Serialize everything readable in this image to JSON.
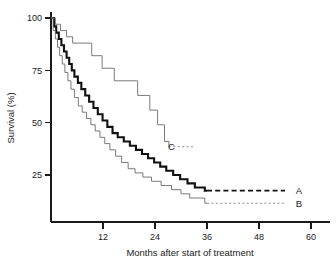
{
  "chart_data": {
    "type": "line",
    "title": "",
    "subtitle": "",
    "xlabel": "Months after start of treatment",
    "ylabel": "Survival (%)",
    "xlim": [
      0,
      60
    ],
    "ylim": [
      0,
      100
    ],
    "xticks": [
      12,
      24,
      36,
      48,
      60
    ],
    "xticklabels": [
      "12",
      "24",
      "36",
      "48",
      "60"
    ],
    "yticks": [
      25,
      50,
      75,
      100
    ],
    "yticklabels": [
      "25",
      "50",
      "75",
      "100"
    ],
    "grid": false,
    "legend_position": "inline-right-labels",
    "annotations": [
      {
        "text": "A",
        "x": 56.5,
        "y": 17.5,
        "leader": "dashed-bold",
        "leader_from_x": 36.0,
        "leader_to_x": 54.0
      },
      {
        "text": "B",
        "x": 56.5,
        "y": 11.5,
        "leader": "dotted-thin",
        "leader_from_x": 36.0,
        "leader_to_x": 54.0
      },
      {
        "text": "C",
        "x": 27.0,
        "y": 38.5,
        "leader": "dotted-thin",
        "leader_from_x": 27.2,
        "leader_to_x": 33.0
      }
    ],
    "series": [
      {
        "name": "A",
        "label": "A",
        "style": "bold-solid-black",
        "color": "#111111",
        "final_survival_pct": 17.5,
        "last_event_month": 35.5,
        "steps": [
          [
            0.0,
            100
          ],
          [
            0.7,
            96
          ],
          [
            1.2,
            93
          ],
          [
            1.8,
            90
          ],
          [
            2.4,
            87
          ],
          [
            3.0,
            84
          ],
          [
            3.6,
            81
          ],
          [
            4.2,
            78
          ],
          [
            4.8,
            75
          ],
          [
            5.4,
            72
          ],
          [
            6.2,
            69
          ],
          [
            7.0,
            66
          ],
          [
            7.9,
            63
          ],
          [
            8.8,
            60
          ],
          [
            9.8,
            57
          ],
          [
            10.8,
            54
          ],
          [
            11.9,
            51
          ],
          [
            13.0,
            48
          ],
          [
            14.2,
            45
          ],
          [
            15.4,
            43
          ],
          [
            16.8,
            41
          ],
          [
            18.2,
            39
          ],
          [
            19.6,
            37
          ],
          [
            21.0,
            35
          ],
          [
            22.4,
            33
          ],
          [
            23.8,
            31
          ],
          [
            25.2,
            29
          ],
          [
            26.6,
            27
          ],
          [
            28.2,
            25
          ],
          [
            29.8,
            23
          ],
          [
            31.5,
            21
          ],
          [
            33.2,
            19
          ],
          [
            35.5,
            17.5
          ],
          [
            36.0,
            17.5
          ]
        ]
      },
      {
        "name": "B",
        "label": "B",
        "style": "thin-solid-grey",
        "color": "#6b6b6b",
        "final_survival_pct": 11.5,
        "last_event_month": 35.5,
        "steps": [
          [
            0.0,
            100
          ],
          [
            0.5,
            94
          ],
          [
            1.0,
            90
          ],
          [
            1.5,
            86
          ],
          [
            2.0,
            82
          ],
          [
            2.6,
            78
          ],
          [
            3.2,
            74
          ],
          [
            3.9,
            70
          ],
          [
            4.6,
            66
          ],
          [
            5.4,
            62
          ],
          [
            6.3,
            58
          ],
          [
            7.2,
            55
          ],
          [
            8.2,
            52
          ],
          [
            9.2,
            49
          ],
          [
            10.2,
            46
          ],
          [
            11.3,
            43
          ],
          [
            12.4,
            40
          ],
          [
            13.6,
            37
          ],
          [
            14.9,
            34
          ],
          [
            16.3,
            31
          ],
          [
            17.8,
            28
          ],
          [
            19.4,
            26
          ],
          [
            21.2,
            24
          ],
          [
            23.2,
            22
          ],
          [
            25.4,
            20
          ],
          [
            27.8,
            18
          ],
          [
            30.0,
            16
          ],
          [
            32.0,
            14
          ],
          [
            35.5,
            11.5
          ],
          [
            36.0,
            11.5
          ]
        ]
      },
      {
        "name": "C",
        "label": "C",
        "style": "thin-solid-grey",
        "color": "#6b6b6b",
        "final_survival_pct": 38.5,
        "last_event_month": 27.2,
        "steps": [
          [
            0.0,
            100
          ],
          [
            1.0,
            97
          ],
          [
            2.2,
            94
          ],
          [
            3.6,
            91
          ],
          [
            5.0,
            88
          ],
          [
            9.2,
            88
          ],
          [
            9.4,
            82
          ],
          [
            11.6,
            82
          ],
          [
            11.8,
            76
          ],
          [
            14.4,
            76
          ],
          [
            14.6,
            70
          ],
          [
            19.8,
            70
          ],
          [
            20.0,
            63
          ],
          [
            22.6,
            63
          ],
          [
            22.8,
            56
          ],
          [
            24.4,
            56
          ],
          [
            24.6,
            49
          ],
          [
            26.0,
            49
          ],
          [
            26.2,
            41
          ],
          [
            27.2,
            41
          ],
          [
            27.2,
            38.5
          ]
        ]
      }
    ]
  }
}
